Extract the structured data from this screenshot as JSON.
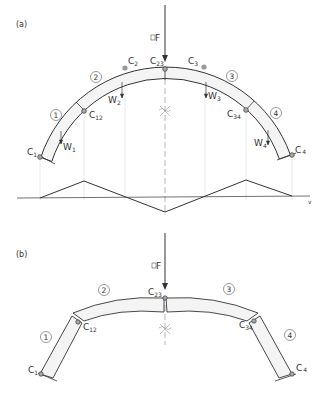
{
  "panels": [
    {
      "id": "a",
      "label": "(a)",
      "force_label": "F",
      "segments": [
        "1",
        "2",
        "3",
        "4"
      ],
      "hinges": {
        "C1": {
          "main": "C",
          "sub": "1"
        },
        "C12": {
          "main": "C",
          "sub": "12"
        },
        "C23": {
          "main": "C",
          "sub": "23"
        },
        "C34": {
          "main": "C",
          "sub": "34"
        },
        "C4": {
          "main": "C",
          "sub": "4"
        }
      },
      "centroids": {
        "C2": {
          "main": "C",
          "sub": "2"
        },
        "C3": {
          "main": "C",
          "sub": "3"
        }
      },
      "weights": {
        "W1": {
          "main": "W",
          "sub": "1"
        },
        "W2": {
          "main": "W",
          "sub": "2"
        },
        "W3": {
          "main": "W",
          "sub": "3"
        },
        "W4": {
          "main": "W",
          "sub": "4"
        }
      },
      "velocity_axis_label": "v"
    },
    {
      "id": "b",
      "label": "(b)",
      "force_label": "F",
      "segments": [
        "1",
        "2",
        "3",
        "4"
      ],
      "hinges": {
        "C1": {
          "main": "C",
          "sub": "1"
        },
        "C12": {
          "main": "C",
          "sub": "12"
        },
        "C23": {
          "main": "C",
          "sub": "23"
        },
        "C34": {
          "main": "C",
          "sub": "34"
        },
        "C4": {
          "main": "C",
          "sub": "4"
        }
      }
    }
  ],
  "colors": {
    "line": "#333333",
    "arch_fill": "#f4f4f4",
    "centroid": "#999999",
    "guide": "#d8d8d8"
  }
}
